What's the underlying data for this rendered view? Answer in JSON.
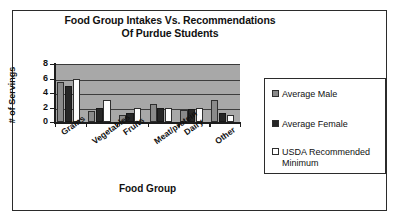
{
  "figure": {
    "title_line1": "Food Group Intakes Vs. Recommendations",
    "title_line2": "Of Purdue Students"
  },
  "legend": {
    "position": "right",
    "entries": [
      {
        "label": "Average Male",
        "color": "#8a8a8a",
        "key": "male"
      },
      {
        "label": "Average Female",
        "color": "#262626",
        "key": "female"
      },
      {
        "label": "USDA Recommended Minimum",
        "color": "#ffffff",
        "key": "usda"
      }
    ]
  },
  "axes": {
    "ylabel": "# of Servings",
    "xlabel": "Food Group",
    "yticks": [
      "8",
      "6",
      "4",
      "2",
      "0"
    ]
  },
  "chart_data": {
    "type": "bar",
    "title": "Food Group Intakes Vs. Recommendations Of Purdue Students",
    "xlabel": "Food Group",
    "ylabel": "# of Servings",
    "ylim": [
      0,
      8
    ],
    "yticks": [
      0,
      2,
      4,
      6,
      8
    ],
    "grid": true,
    "legend_position": "right",
    "categories": [
      "Grains",
      "Vegetables",
      "Fruits",
      "Meat/protein",
      "Dairy",
      "Other"
    ],
    "series": [
      {
        "name": "Average Male",
        "color": "#8a8a8a",
        "values": [
          5.5,
          1.5,
          1.0,
          2.5,
          1.7,
          3.0
        ]
      },
      {
        "name": "Average Female",
        "color": "#262626",
        "values": [
          5.0,
          2.0,
          1.2,
          2.0,
          1.8,
          1.2
        ]
      },
      {
        "name": "USDA Recommended Minimum",
        "color": "#ffffff",
        "values": [
          6.0,
          3.0,
          2.0,
          2.0,
          2.0,
          1.0
        ]
      }
    ]
  }
}
